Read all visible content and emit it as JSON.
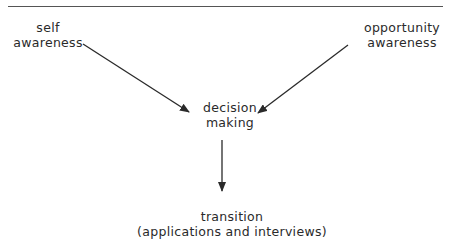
{
  "diagram": {
    "nodes": {
      "self_awareness": {
        "line1": "self",
        "line2": "awareness"
      },
      "opportunity_awareness": {
        "line1": "opportunity",
        "line2": "awareness"
      },
      "decision_making": {
        "line1": "decision",
        "line2": "making"
      },
      "transition": {
        "line1": "transition",
        "line2": "(applications and interviews)"
      }
    },
    "edges": [
      {
        "from": "self_awareness",
        "to": "decision_making"
      },
      {
        "from": "opportunity_awareness",
        "to": "decision_making"
      },
      {
        "from": "decision_making",
        "to": "transition"
      }
    ],
    "colors": {
      "line": "#2a2a2a",
      "text": "#2a2a2a",
      "rule": "#555555"
    }
  }
}
